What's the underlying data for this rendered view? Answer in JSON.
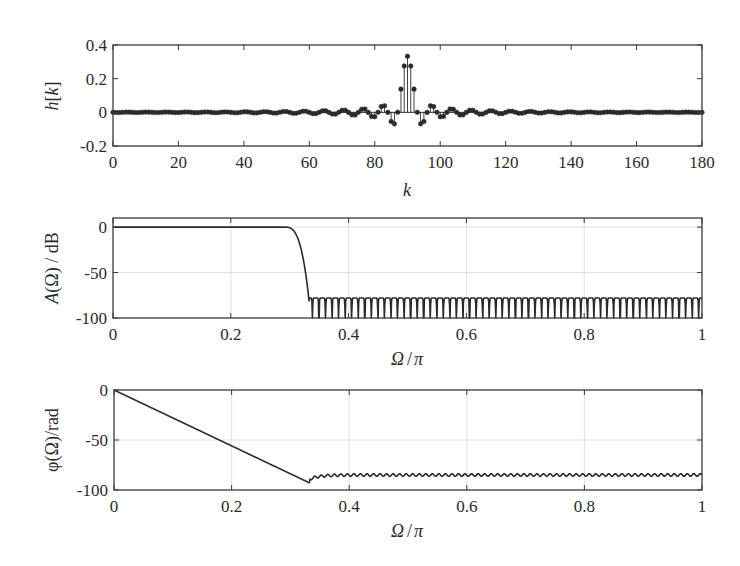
{
  "chart_data": [
    {
      "type": "stem",
      "title": "",
      "xlabel": "k",
      "ylabel": "h[k]",
      "xlim": [
        0,
        180
      ],
      "ylim": [
        -0.2,
        0.4
      ],
      "xticks": [
        0,
        20,
        40,
        60,
        80,
        100,
        120,
        140,
        160,
        180
      ],
      "xtick_labels": [
        "0",
        "20",
        "40",
        "60",
        "80",
        "100",
        "120",
        "140",
        "160",
        "180"
      ],
      "yticks": [
        0.4,
        0.2,
        0,
        -0.2
      ],
      "ytick_labels": [
        "0.4",
        "0.2",
        "0",
        "-0.2"
      ],
      "grid": false,
      "description": "Impulse response of a linear-phase FIR lowpass filter (181 taps), sinc-shaped, centered at k=90",
      "center_index": 90,
      "peak_value": 0.333,
      "cutoff_normalized": 0.333,
      "num_taps": 181
    },
    {
      "type": "line",
      "title": "",
      "xlabel": "Ω/π",
      "ylabel": "A(Ω) / dB",
      "xlim": [
        0,
        1
      ],
      "ylim": [
        -100,
        10
      ],
      "xticks": [
        0,
        0.2,
        0.4,
        0.6,
        0.8,
        1
      ],
      "xtick_labels": [
        "0",
        "0.2",
        "0.4",
        "0.6",
        "0.8",
        "1"
      ],
      "yticks": [
        0,
        -50,
        -100
      ],
      "ytick_labels": [
        "0",
        "-50",
        "-100"
      ],
      "grid": true,
      "description": "Magnitude response: passband at 0 dB until ~0.3, steep transition to stopband at ~0.333, stopband ripples around -80 dB with nulls to -100 dB",
      "x": [
        0,
        0.1,
        0.2,
        0.28,
        0.3,
        0.31,
        0.32,
        0.325,
        0.33,
        0.333,
        0.4,
        0.6,
        0.8,
        1.0
      ],
      "values": [
        0,
        0,
        0,
        0,
        -1,
        -5,
        -15,
        -30,
        -60,
        -82,
        -80,
        -80,
        -80,
        -80
      ],
      "stopband_peak_db": -78,
      "stopband_null_db": -100
    },
    {
      "type": "line",
      "title": "",
      "xlabel": "Ω/π",
      "ylabel": "φ(Ω) /rad",
      "xlim": [
        0,
        1
      ],
      "ylim": [
        -100,
        0
      ],
      "xticks": [
        0,
        0.2,
        0.4,
        0.6,
        0.8,
        1
      ],
      "xtick_labels": [
        "0",
        "0.2",
        "0.4",
        "0.6",
        "0.8",
        "1"
      ],
      "yticks": [
        0,
        -50,
        -100
      ],
      "ytick_labels": [
        "0",
        "-50",
        "-100"
      ],
      "grid": true,
      "description": "Unwrapped phase: linear decrease from 0 to about -93 rad at Ω/π≈0.333, then small ripples around -85 rad",
      "x": [
        0,
        0.1,
        0.2,
        0.3,
        0.333,
        0.35,
        0.4,
        0.6,
        0.8,
        1.0
      ],
      "values": [
        0,
        -28,
        -56,
        -84,
        -93,
        -88,
        -86,
        -85,
        -85,
        -85
      ]
    }
  ],
  "figure": {
    "panels": [
      {
        "ylabel_main": "h",
        "ylabel_bracket_open": "[",
        "ylabel_var": "k",
        "ylabel_bracket_close": "]",
        "xlabel": "k"
      },
      {
        "ylabel_func": "A",
        "ylabel_arg": "(Ω)",
        "ylabel_unit": " / dB",
        "xlabel_num": "Ω",
        "xlabel_sep": "/",
        "xlabel_den": "π"
      },
      {
        "ylabel_func": "φ",
        "ylabel_arg": "(Ω)",
        "ylabel_unit": "/rad",
        "xlabel_num": "Ω",
        "xlabel_sep": "/",
        "xlabel_den": "π"
      }
    ]
  },
  "colors": {
    "line": "#2a2a2a",
    "axes": "#3a3a3a",
    "grid": "#d8d8d8",
    "background": "#ffffff"
  }
}
